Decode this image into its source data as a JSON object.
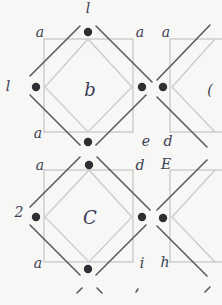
{
  "diagram": {
    "colors": {
      "paper": "#f7f7f5",
      "square": "#c4c4c4",
      "diamond": "#c9c9c9",
      "diagonal": "#5b5b63",
      "dot": "#2f2f33",
      "ink": "#3a3d52"
    },
    "cells": [
      {
        "id": "cell-b",
        "label": "b"
      },
      {
        "id": "cell-c",
        "label": "C"
      }
    ],
    "labels": [
      {
        "id": "top-1",
        "text": "l"
      },
      {
        "id": "a-1",
        "text": "a"
      },
      {
        "id": "a-2",
        "text": "a"
      },
      {
        "id": "a-3",
        "text": "a"
      },
      {
        "id": "left-1",
        "text": "l"
      },
      {
        "id": "a-4",
        "text": "a"
      },
      {
        "id": "e-1",
        "text": "e"
      },
      {
        "id": "d-1",
        "text": "d"
      },
      {
        "id": "partial-c",
        "text": "("
      },
      {
        "id": "a-5",
        "text": "a"
      },
      {
        "id": "d-2",
        "text": "d"
      },
      {
        "id": "E-1",
        "text": "E"
      },
      {
        "id": "left-2",
        "text": "2"
      },
      {
        "id": "a-6",
        "text": "a"
      },
      {
        "id": "i-1",
        "text": "i"
      },
      {
        "id": "h-1",
        "text": "h"
      }
    ]
  }
}
